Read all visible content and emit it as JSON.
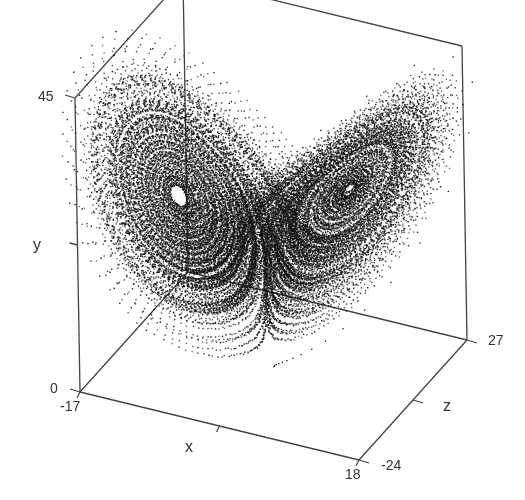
{
  "chart_data": {
    "type": "scatter",
    "subtype": "3d-point-cloud",
    "title": "",
    "axes": {
      "x": {
        "label": "x",
        "min": -17,
        "max": 18,
        "tick_labels": [
          "-17",
          "18"
        ]
      },
      "y": {
        "label": "y",
        "min": 0,
        "max": 45,
        "tick_labels": [
          "0",
          "45"
        ]
      },
      "z": {
        "label": "z",
        "min": -24,
        "max": 27,
        "tick_labels": [
          "-24",
          "27"
        ]
      }
    },
    "grid": false,
    "legend": null,
    "color": "#111111",
    "background": "#ffffff",
    "lorenz_params": {
      "sigma": 10,
      "rho": 28,
      "beta": 2.6667
    },
    "features": [
      "left lobe with small hollow center",
      "right lobe with larger hollow elliptical center",
      "transient trajectory tail near the bottom center"
    ]
  },
  "labels": {
    "y_max": "45",
    "y_min": "0",
    "y_name": "y",
    "x_min": "-17",
    "x_max": "18",
    "x_name": "x",
    "z_min": "-24",
    "z_max": "27",
    "z_name": "z"
  }
}
